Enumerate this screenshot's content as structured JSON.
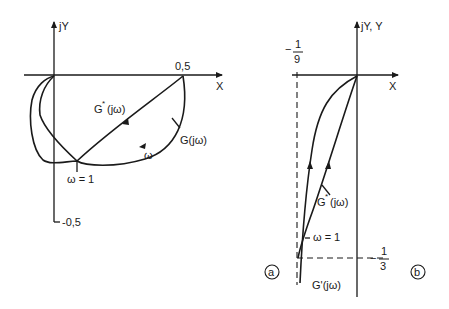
{
  "figure_a": {
    "panel_label": "a",
    "y_axis_label": "jY",
    "x_axis_label": "X",
    "tick_x": "0,5",
    "tick_y": "-0,5",
    "curves": [
      {
        "name": "G*(jω)",
        "label_main": "G",
        "label_sup": "*",
        "label_tail": "(jω)"
      },
      {
        "name": "G(jω)",
        "label": "G(jω)"
      }
    ],
    "omega_label": "ω",
    "omega_point_label": "ω = 1"
  },
  "figure_b": {
    "panel_label": "b",
    "y_axis_label": "jY, Y",
    "x_axis_label": "X",
    "tick_left_num": "1",
    "tick_left_den": "9",
    "tick_left_sign": "−",
    "tick_bottom_num": "1",
    "tick_bottom_den": "3",
    "tick_bottom_sign": "−",
    "curves": [
      {
        "name": "G*(jω)",
        "label_main": "G",
        "label_sup": "*",
        "label_tail": "(jω)"
      },
      {
        "name": "G'(jω)",
        "label": "G'(jω)"
      }
    ],
    "omega_point_label": "ω = 1"
  }
}
